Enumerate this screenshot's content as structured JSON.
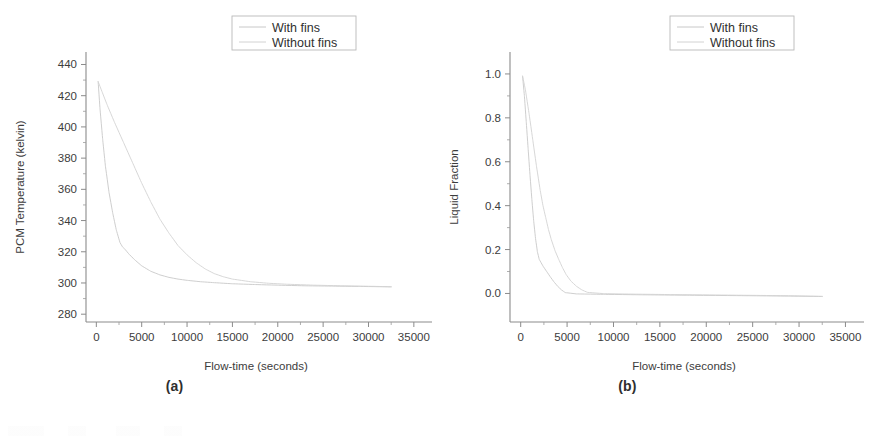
{
  "figure": {
    "panels": [
      {
        "id": "a",
        "caption": "(a)",
        "legend": {
          "items": [
            "With fins",
            "Without fins"
          ]
        }
      },
      {
        "id": "b",
        "caption": "(b)",
        "legend": {
          "items": [
            "With fins",
            "Without fins"
          ]
        }
      }
    ]
  },
  "chart_data": [
    {
      "type": "line",
      "panel": "a",
      "title": "",
      "xlabel": "Flow-time (seconds)",
      "ylabel": "PCM Temperature (kelvin)",
      "xlim": [
        -1800,
        37000
      ],
      "ylim": [
        275,
        448
      ],
      "xticks": [
        0,
        5000,
        10000,
        15000,
        20000,
        25000,
        30000,
        35000
      ],
      "xticklabels": [
        "0",
        "5000",
        "10000",
        "15000",
        "20000",
        "25000",
        "30000",
        "35000"
      ],
      "yticks": [
        280,
        300,
        320,
        340,
        360,
        380,
        400,
        420,
        440
      ],
      "yticklabels": [
        "280",
        "300",
        "320",
        "340",
        "360",
        "380",
        "400",
        "420",
        "440"
      ],
      "grid": false,
      "legend_position": "outside-top-right",
      "series": [
        {
          "name": "With fins",
          "color": "#c8c8c8",
          "x": [
            200,
            400,
            700,
            1000,
            1400,
            1800,
            2200,
            2600,
            2900,
            3100,
            3600,
            4200,
            5000,
            6000,
            7000,
            8000,
            9000,
            10000,
            11500,
            13000,
            15000,
            17500,
            20000,
            23000,
            26000,
            29000,
            32500
          ],
          "y": [
            429,
            412,
            392,
            375,
            358,
            345,
            334,
            326,
            323,
            322,
            318.5,
            315,
            311,
            307.5,
            305.2,
            303.6,
            302.5,
            301.7,
            300.8,
            300.2,
            299.5,
            299.0,
            298.6,
            298.2,
            298.0,
            297.8,
            297.5
          ]
        },
        {
          "name": "Without fins",
          "color": "#d2d2d2",
          "x": [
            200,
            600,
            1200,
            2000,
            3000,
            4000,
            5000,
            6000,
            7000,
            8000,
            9000,
            10000,
            11000,
            12000,
            13000,
            14000,
            15000,
            17000,
            19000,
            21000,
            24000,
            27000,
            30000,
            32500
          ],
          "y": [
            429,
            423,
            414,
            403,
            390,
            377,
            364,
            352,
            341,
            332,
            324,
            318,
            313,
            309,
            306,
            304,
            302.5,
            300.8,
            299.8,
            299.2,
            298.6,
            298.2,
            297.9,
            297.6
          ]
        }
      ]
    },
    {
      "type": "line",
      "panel": "b",
      "title": "",
      "xlabel": "Flow-time (seconds)",
      "ylabel": "Liquid Fraction",
      "xlim": [
        -1800,
        37000
      ],
      "ylim": [
        -0.13,
        1.1
      ],
      "xticks": [
        0,
        5000,
        10000,
        15000,
        20000,
        25000,
        30000,
        35000
      ],
      "xticklabels": [
        "0",
        "5000",
        "10000",
        "15000",
        "20000",
        "25000",
        "30000",
        "35000"
      ],
      "yticks": [
        0.0,
        0.2,
        0.4,
        0.6,
        0.8,
        1.0
      ],
      "yticklabels": [
        "0.0",
        "0.2",
        "0.4",
        "0.6",
        "0.8",
        "1.0"
      ],
      "grid": false,
      "legend_position": "outside-top-right",
      "series": [
        {
          "name": "With fins",
          "color": "#c8c8c8",
          "x": [
            200,
            400,
            600,
            800,
            1000,
            1200,
            1400,
            1600,
            1800,
            2000,
            2400,
            2800,
            3200,
            3600,
            4000,
            4400,
            4800,
            6000,
            9000,
            13000,
            18000,
            24000,
            29000,
            32500
          ],
          "y": [
            0.99,
            0.9,
            0.78,
            0.66,
            0.54,
            0.43,
            0.33,
            0.25,
            0.19,
            0.155,
            0.125,
            0.1,
            0.075,
            0.052,
            0.032,
            0.016,
            0.004,
            -0.002,
            -0.004,
            -0.006,
            -0.008,
            -0.01,
            -0.012,
            -0.014
          ]
        },
        {
          "name": "Without fins",
          "color": "#d2d2d2",
          "x": [
            200,
            500,
            900,
            1300,
            1700,
            2100,
            2400,
            2700,
            3000,
            3300,
            3700,
            4100,
            4500,
            4900,
            5400,
            6000,
            6600,
            7200,
            9000,
            12000,
            16000,
            21000,
            26000,
            30000,
            32500
          ],
          "y": [
            0.99,
            0.93,
            0.82,
            0.7,
            0.58,
            0.47,
            0.4,
            0.345,
            0.29,
            0.245,
            0.195,
            0.155,
            0.118,
            0.086,
            0.057,
            0.033,
            0.016,
            0.005,
            -0.001,
            -0.003,
            -0.005,
            -0.007,
            -0.009,
            -0.011,
            -0.013
          ]
        }
      ]
    }
  ]
}
